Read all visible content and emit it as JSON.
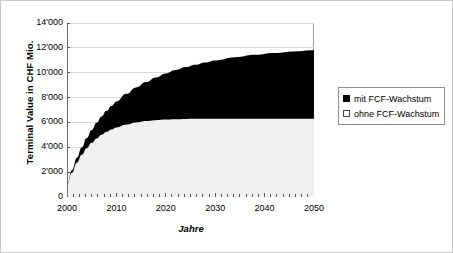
{
  "chart_data": {
    "type": "area",
    "title": "",
    "subtitle": "",
    "xlabel": "Jahre",
    "ylabel": "Terminal Value in CHF Mio.",
    "xlim": [
      2000,
      2050
    ],
    "ylim": [
      0,
      14000
    ],
    "grid": true,
    "legend_position": "right",
    "x_tick_labels": [
      "2000",
      "2010",
      "2020",
      "2030",
      "2040",
      "2050"
    ],
    "x_ticks": [
      2000,
      2010,
      2020,
      2030,
      2040,
      2050
    ],
    "x_minor_tick_step": 1.25,
    "y_tick_labels": [
      "0",
      "2'000",
      "4'000",
      "6'000",
      "8'000",
      "10'000",
      "12'000",
      "14'000"
    ],
    "y_ticks": [
      0,
      2000,
      4000,
      6000,
      8000,
      10000,
      12000,
      14000
    ],
    "x": [
      2000,
      2001,
      2002,
      2003,
      2004,
      2005,
      2006,
      2007,
      2008,
      2009,
      2010,
      2012,
      2014,
      2016,
      2018,
      2020,
      2022,
      2024,
      2026,
      2028,
      2030,
      2034,
      2038,
      2042,
      2046,
      2050
    ],
    "series": [
      {
        "name": "mit FCF-Wachstum",
        "color": "#000000",
        "values": [
          1000,
          2150,
          3150,
          4000,
          4750,
          5400,
          5980,
          6480,
          6930,
          7330,
          7690,
          8300,
          8820,
          9250,
          9620,
          9940,
          10210,
          10450,
          10650,
          10830,
          10990,
          11240,
          11440,
          11590,
          11710,
          11800
        ]
      },
      {
        "name": "ohne FCF-Wachstum",
        "color": "#f0f0f0",
        "values": [
          1000,
          1950,
          2760,
          3400,
          3930,
          4360,
          4710,
          5000,
          5240,
          5440,
          5600,
          5840,
          6000,
          6110,
          6180,
          6230,
          6260,
          6280,
          6290,
          6295,
          6300,
          6300,
          6300,
          6300,
          6300,
          6300
        ]
      }
    ]
  },
  "legend": {
    "items": [
      {
        "label": "mit FCF-Wachstum",
        "marker": "filled-square"
      },
      {
        "label": "ohne FCF-Wachstum",
        "marker": "empty-square"
      }
    ]
  },
  "colors": {
    "series_with_growth": "#000000",
    "series_without_growth": "#f0f0f0",
    "plot_border": "#9a9a9a",
    "gridline": "#d9d9d9",
    "figure_border": "#c8c8c8",
    "axis": "#6e6e6e"
  }
}
